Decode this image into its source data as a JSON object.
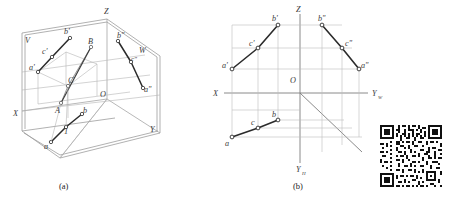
{
  "figure": {
    "captions": {
      "a": "(a)",
      "b": "(b)"
    }
  },
  "diagram_a": {
    "name": "axonometric-three-plane-projection",
    "plane_labels": {
      "v_plane": "V",
      "w_plane": "W"
    },
    "axis_labels": {
      "z": "Z",
      "x": "X",
      "y": "Y",
      "origin": "O"
    },
    "space_points": {
      "A": "A",
      "B": "B",
      "C": "C"
    },
    "frontal_projections": {
      "a_prime": "a'",
      "b_prime": "b'",
      "c_prime": "c'"
    },
    "profile_projections": {
      "a_double_prime": "a\"",
      "b_double_prime": "b\"",
      "c_double_prime": "c\""
    },
    "horizontal_projections": {
      "a": "a",
      "b": "b",
      "c": "1"
    }
  },
  "diagram_b": {
    "name": "orthographic-projection-layout",
    "axis_labels": {
      "z": "Z",
      "x": "X",
      "y_w": "Y",
      "y_w_sub": "W",
      "y_h": "Y",
      "y_h_sub": "H",
      "origin": "O"
    },
    "frontal_projections": {
      "a_prime": "a'",
      "b_prime": "b'",
      "c_prime": "c'"
    },
    "profile_projections": {
      "a_double_prime": "a\"",
      "b_double_prime": "b\"",
      "c_double_prime": "c\""
    },
    "horizontal_projections": {
      "a": "a",
      "b": "b",
      "c": "c"
    }
  },
  "qr_code": {
    "name": "qr-code",
    "description": "scannable-code"
  },
  "colors": {
    "ink": "#3a3a3a",
    "thin_line": "#9a9a9a",
    "thick_line": "#2a2a2a",
    "plane_edge": "#8c8c8c",
    "background": "#ffffff",
    "qr_dark": "#101010"
  }
}
